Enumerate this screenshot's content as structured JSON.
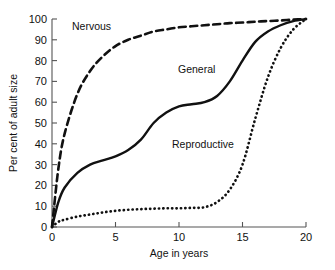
{
  "chart_data": {
    "type": "line",
    "title": "",
    "xlabel": "Age in years",
    "ylabel": "Per cent of adult size",
    "xlim": [
      0,
      20
    ],
    "ylim": [
      0,
      100
    ],
    "grid": false,
    "legend_position": "inline-annotations",
    "xticks": [
      0,
      5,
      10,
      15,
      20
    ],
    "xtick_labels": [
      "0",
      "5",
      "10",
      "15",
      "20"
    ],
    "yticks": [
      0,
      10,
      20,
      30,
      40,
      50,
      60,
      70,
      80,
      90,
      100
    ],
    "ytick_labels": [
      "0",
      "10",
      "20",
      "30",
      "40",
      "50",
      "60",
      "70",
      "80",
      "90",
      "100"
    ],
    "x": [
      0,
      0.5,
      1,
      2,
      3,
      4,
      5,
      6,
      7,
      8,
      9,
      10,
      11,
      12,
      13,
      14,
      15,
      16,
      17,
      18,
      19,
      20
    ],
    "series": [
      {
        "name": "Nervous",
        "style": "dashed",
        "color": "#111111",
        "values": [
          0,
          28,
          45,
          64,
          75,
          82,
          87,
          90,
          92,
          94,
          95,
          96,
          96.5,
          97,
          97.5,
          98,
          98.3,
          98.7,
          99,
          99.3,
          99.7,
          100
        ]
      },
      {
        "name": "General",
        "style": "solid",
        "color": "#111111",
        "values": [
          0,
          12,
          19,
          26,
          30,
          32,
          34,
          37,
          42,
          50,
          55,
          58,
          59,
          60,
          63,
          70,
          80,
          89,
          94,
          97,
          99,
          100
        ]
      },
      {
        "name": "Reproductive",
        "style": "dotted",
        "color": "#111111",
        "values": [
          0,
          2.5,
          3.5,
          5,
          6,
          7,
          7.8,
          8.3,
          8.6,
          8.8,
          9,
          9,
          9.2,
          9.5,
          12,
          18,
          30,
          52,
          72,
          86,
          95,
          100
        ]
      }
    ],
    "annotations": [
      {
        "text": "Nervous",
        "x_px": 72,
        "y_px": 30
      },
      {
        "text": "General",
        "x_px": 178,
        "y_px": 73
      },
      {
        "text": "Reproductive",
        "x_px": 172,
        "y_px": 148
      }
    ]
  }
}
